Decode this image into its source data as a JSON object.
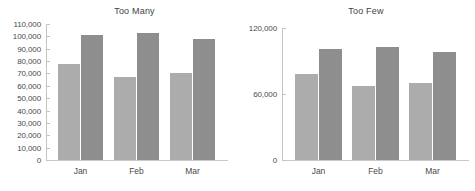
{
  "figure": {
    "panels": [
      "too_many",
      "too_few"
    ]
  },
  "chart_data": [
    {
      "id": "too_many",
      "type": "bar",
      "title": "Too Many",
      "xlabel": "",
      "ylabel": "",
      "categories": [
        "Jan",
        "Feb",
        "Mar"
      ],
      "series": [
        {
          "name": "Series 1",
          "values": [
            78000,
            67000,
            70000
          ],
          "color": "#acacac"
        },
        {
          "name": "Series 2",
          "values": [
            101000,
            103000,
            98000
          ],
          "color": "#8e8e8e"
        }
      ],
      "ylim": [
        0,
        110000
      ],
      "ytick_step": 10000,
      "ytick_labels": [
        "0",
        "10,000",
        "20,000",
        "30,000",
        "40,000",
        "50,000",
        "60,000",
        "70,000",
        "80,000",
        "90,000",
        "100,000",
        "110,000"
      ],
      "ytick_values": [
        0,
        10000,
        20000,
        30000,
        40000,
        50000,
        60000,
        70000,
        80000,
        90000,
        100000,
        110000
      ],
      "grid": false,
      "legend": "none"
    },
    {
      "id": "too_few",
      "type": "bar",
      "title": "Too Few",
      "xlabel": "",
      "ylabel": "",
      "categories": [
        "Jan",
        "Feb",
        "Mar"
      ],
      "series": [
        {
          "name": "Series 1",
          "values": [
            78000,
            67000,
            70000
          ],
          "color": "#acacac"
        },
        {
          "name": "Series 2",
          "values": [
            101000,
            103000,
            98000
          ],
          "color": "#8e8e8e"
        }
      ],
      "ylim": [
        0,
        120000
      ],
      "ytick_step": 60000,
      "ytick_labels": [
        "0",
        "60,000",
        "120,000"
      ],
      "ytick_values": [
        0,
        60000,
        120000
      ],
      "grid": false,
      "legend": "none"
    }
  ],
  "colors": {
    "series_a": "#acacac",
    "series_b": "#8e8e8e",
    "axis": "#c4c4c4",
    "text": "#4a4a4a",
    "background": "#ffffff"
  }
}
